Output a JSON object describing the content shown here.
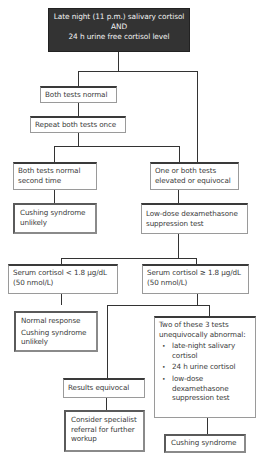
{
  "diagram": {
    "start": {
      "line1": "Late night (11 p.m.) salivary cortisol",
      "line2": "AND",
      "line3": "24 h urine free cortisol level"
    },
    "both_normal": "Both tests normal",
    "repeat": "Repeat both tests once",
    "normal_second": "Both tests normal second time",
    "elevated": "One or both tests elevated or equivocal",
    "unlikely1": "Cushing syndrome unlikely",
    "low_dose": "Low-dose dexamethasone suppression test",
    "serum_low": {
      "line1": "Serum cortisol < 1.8 μg/dL",
      "line2": "(50 nmol/L)"
    },
    "serum_high": {
      "line1": "Serum cortisol ≥ 1.8 μg/dL",
      "line2": "(50 nmol/L)"
    },
    "normal_response": {
      "line1": "Normal response",
      "line2": "Cushing syndrome unlikely"
    },
    "two_of_three": {
      "heading": "Two of these 3 tests unequivocally abnormal:",
      "items": [
        "late-night salivary cortisol",
        "24 h urine cortisol",
        "low-dose dexamethasone suppression test"
      ]
    },
    "results_equivocal": "Results equivocal",
    "specialist": "Consider specialist referral for further workup",
    "cushing": "Cushing syndrome"
  }
}
